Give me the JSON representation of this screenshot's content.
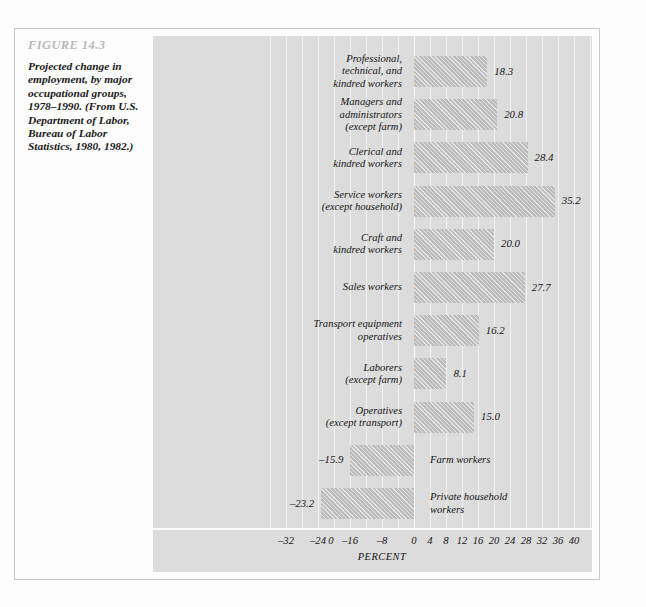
{
  "figure": {
    "number_label": "FIGURE 14.3",
    "caption": "Projected change in employment, by major occupational groups, 1978–1990. (From U.S. Department of Labor, Bureau of Labor Statistics, 1980, 1982.)"
  },
  "colors": {
    "page_background": "#fdfdfd",
    "plot_background": "#dcdcdc",
    "bar_fill": "#bdbdbd",
    "gridline": "#f2f2f2",
    "figure_number_text": "#b9b9b9",
    "body_text": "#141414",
    "frame_border": "#c9c9c9"
  },
  "chart_data": {
    "type": "bar",
    "orientation": "horizontal",
    "title": "Projected change in employment, by major occupational groups, 1978–1990",
    "xlabel": "PERCENT",
    "ylabel": "",
    "grid": true,
    "legend": "none",
    "xlim": [
      -36,
      42
    ],
    "xticks_negative": [
      -32,
      -24,
      -16,
      -8,
      0
    ],
    "xticks_negative_labels": [
      "–32",
      "–24",
      "–16",
      "–8",
      "0"
    ],
    "xticks_positive": [
      0,
      4,
      8,
      12,
      16,
      20,
      24,
      28,
      32,
      36,
      40
    ],
    "xticks_positive_labels": [
      "0",
      "4",
      "8",
      "12",
      "16",
      "20",
      "24",
      "28",
      "32",
      "36",
      "40"
    ],
    "gridline_step": 4,
    "categories": [
      "Professional, technical, and kindred workers",
      "Managers and administrators (except farm)",
      "Clerical and kindred workers",
      "Service workers (except household)",
      "Craft and kindred workers",
      "Sales workers",
      "Transport equipment operatives",
      "Laborers (except farm)",
      "Operatives (except transport)",
      "Farm workers",
      "Private household workers"
    ],
    "values": [
      18.3,
      20.8,
      28.4,
      35.2,
      20.0,
      27.7,
      16.2,
      8.1,
      15.0,
      -15.9,
      -23.2
    ],
    "value_labels": [
      "18.3",
      "20.8",
      "28.4",
      "35.2",
      "20.0",
      "27.7",
      "16.2",
      "8.1",
      "15.0",
      "–15.9",
      "–23.2"
    ]
  },
  "rows": [
    {
      "label": "Professional,\ntechnical, and\nkindred workers",
      "value": 18.3,
      "value_label": "18.3",
      "direction": "positive"
    },
    {
      "label": "Managers and\nadministrators\n(except farm)",
      "value": 20.8,
      "value_label": "20.8",
      "direction": "positive"
    },
    {
      "label": "Clerical and\nkindred workers",
      "value": 28.4,
      "value_label": "28.4",
      "direction": "positive"
    },
    {
      "label": "Service workers\n(except household)",
      "value": 35.2,
      "value_label": "35.2",
      "direction": "positive"
    },
    {
      "label": "Craft and\nkindred workers",
      "value": 20.0,
      "value_label": "20.0",
      "direction": "positive"
    },
    {
      "label": "Sales workers",
      "value": 27.7,
      "value_label": "27.7",
      "direction": "positive"
    },
    {
      "label": "Transport equipment\noperatives",
      "value": 16.2,
      "value_label": "16.2",
      "direction": "positive"
    },
    {
      "label": "Laborers\n(except farm)",
      "value": 8.1,
      "value_label": "8.1",
      "direction": "positive"
    },
    {
      "label": "Operatives\n(except transport)",
      "value": 15.0,
      "value_label": "15.0",
      "direction": "positive"
    },
    {
      "label": "Farm workers",
      "value": -15.9,
      "value_label": "–15.9",
      "direction": "negative"
    },
    {
      "label": "Private household\nworkers",
      "value": -23.2,
      "value_label": "–23.2",
      "direction": "negative"
    }
  ],
  "axis": {
    "percent_label": "PERCENT"
  }
}
